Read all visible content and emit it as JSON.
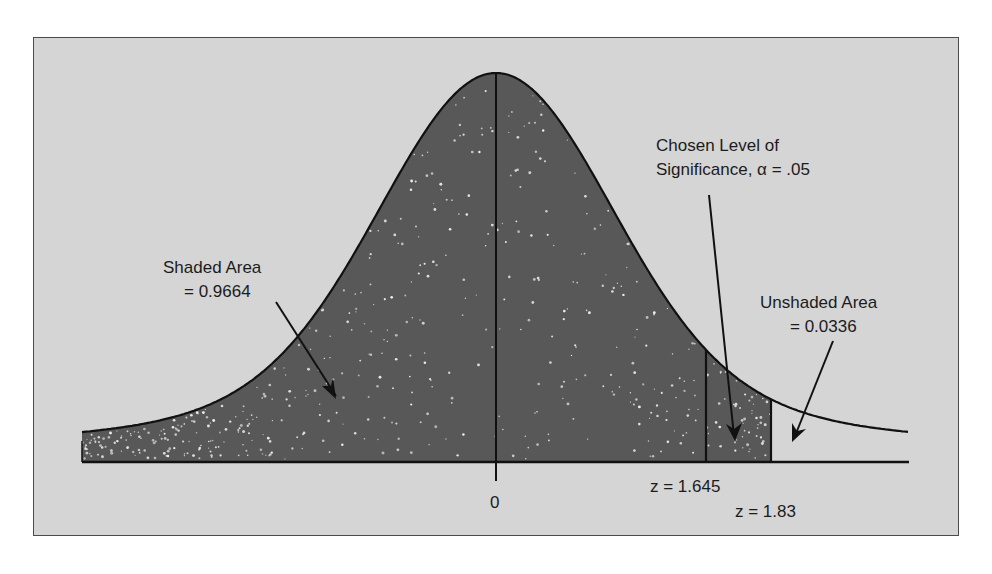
{
  "chart_data": {
    "type": "area",
    "title": "",
    "xlabel": "z",
    "ylabel": "",
    "x_ticks": [
      {
        "value": 0,
        "label": "0"
      }
    ],
    "critical_values": [
      {
        "z": 1.645,
        "label": "z = 1.645"
      },
      {
        "z": 1.83,
        "label": "z = 1.83"
      }
    ],
    "regions": [
      {
        "name": "shaded",
        "from_z": "-inf",
        "to_z": 1.83,
        "area": 0.9664,
        "fill": "#585858"
      },
      {
        "name": "unshaded",
        "from_z": 1.83,
        "to_z": "inf",
        "area": 0.0336,
        "fill": "#d5d5d5"
      }
    ],
    "alpha": 0.05,
    "annotations": [
      {
        "id": "shaded",
        "lines": [
          "Shaded Area",
          "= 0.9664"
        ]
      },
      {
        "id": "alpha",
        "lines": [
          "Chosen Level of",
          "Significance, α = .05"
        ]
      },
      {
        "id": "unshaded",
        "lines": [
          "Unshaded Area",
          "= 0.0336"
        ]
      }
    ],
    "grid": false,
    "legend": "none"
  },
  "labels": {
    "shaded_1": "Shaded Area",
    "shaded_2": "= 0.9664",
    "alpha_1": "Chosen Level of",
    "alpha_2": "Significance, α = .05",
    "unshaded_1": "Unshaded Area",
    "unshaded_2": "= 0.0336",
    "tick_zero": "0",
    "z1": "z = 1.645",
    "z2": "z = 1.83"
  },
  "colors": {
    "background": "#d5d5d5",
    "fill": "#585858",
    "stroke": "#111111",
    "speckle": "#f0f0f0"
  }
}
